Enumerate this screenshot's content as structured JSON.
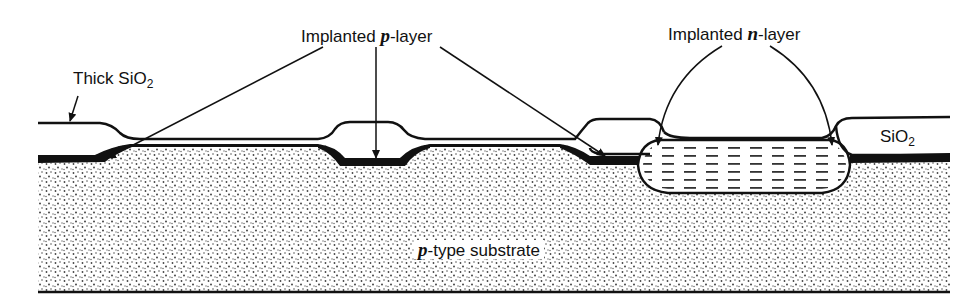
{
  "figure": {
    "type": "cross-section"
  },
  "labels": {
    "thick_sio2": {
      "main": "Thick SiO",
      "sub": "2"
    },
    "p_layer": {
      "prefix": "Implanted ",
      "italic": "p",
      "suffix": "-layer"
    },
    "n_layer": {
      "prefix": "Implanted ",
      "italic": "n",
      "suffix": "-layer"
    },
    "sio2": {
      "main": "SiO",
      "sub": "2"
    },
    "substrate": {
      "italic": "p",
      "suffix": "-type substrate"
    }
  },
  "colors": {
    "ink": "#111111",
    "background": "#ffffff",
    "dots": "#444444"
  }
}
